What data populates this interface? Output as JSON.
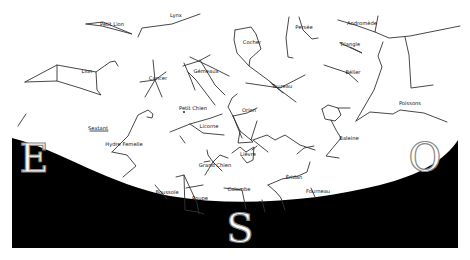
{
  "chart": {
    "type": "sky-map",
    "horizon_color": "#000000",
    "sky_color": "#ffffff",
    "line_color": "#333333"
  },
  "cardinals": [
    {
      "id": "east",
      "label": "E",
      "x": 34,
      "y": 158
    },
    {
      "id": "south",
      "label": "S",
      "x": 240,
      "y": 228
    },
    {
      "id": "west",
      "label": "O",
      "x": 425,
      "y": 157
    }
  ],
  "constellations": [
    {
      "name": "Petit Lion",
      "x": 112,
      "y": 25
    },
    {
      "name": "Lynx",
      "x": 176,
      "y": 16
    },
    {
      "name": "Lion",
      "x": 87,
      "y": 72
    },
    {
      "name": "Cancer",
      "x": 158,
      "y": 79
    },
    {
      "name": "Gémeaux",
      "x": 206,
      "y": 72
    },
    {
      "name": "Cocher",
      "x": 252,
      "y": 43
    },
    {
      "name": "Persée",
      "x": 304,
      "y": 28
    },
    {
      "name": "Andromède",
      "x": 362,
      "y": 24
    },
    {
      "name": "Triangle",
      "x": 350,
      "y": 45
    },
    {
      "name": "Bélier",
      "x": 353,
      "y": 73
    },
    {
      "name": "Taureau",
      "x": 282,
      "y": 87
    },
    {
      "name": "Poissons",
      "x": 410,
      "y": 104
    },
    {
      "name": "Petit Chien",
      "x": 193,
      "y": 109
    },
    {
      "name": "Orion",
      "x": 249,
      "y": 111
    },
    {
      "name": "Licorne",
      "x": 209,
      "y": 127
    },
    {
      "name": "Sextant",
      "x": 98,
      "y": 129
    },
    {
      "name": "Hydre Femelle",
      "x": 124,
      "y": 145
    },
    {
      "name": "Baleine",
      "x": 349,
      "y": 139
    },
    {
      "name": "Lièvre",
      "x": 248,
      "y": 155
    },
    {
      "name": "Grand Chien",
      "x": 215,
      "y": 166
    },
    {
      "name": "Éridan",
      "x": 294,
      "y": 178
    },
    {
      "name": "Fourneau",
      "x": 318,
      "y": 192
    },
    {
      "name": "Boussole",
      "x": 167,
      "y": 193
    },
    {
      "name": "Colombe",
      "x": 239,
      "y": 190
    },
    {
      "name": "Poupe",
      "x": 200,
      "y": 199
    },
    {
      "name": "Burin",
      "x": 265,
      "y": 204
    }
  ]
}
